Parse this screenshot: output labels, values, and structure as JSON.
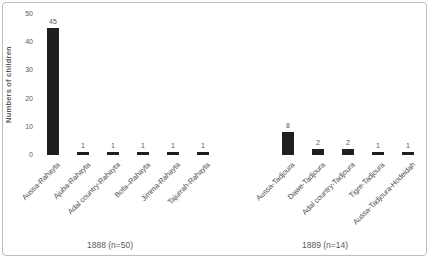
{
  "chart_data": {
    "type": "bar",
    "title": "",
    "ylabel": "Numbers of children",
    "xlabel": "",
    "ylim": [
      0,
      50
    ],
    "yticks": [
      0,
      10,
      20,
      30,
      40,
      50
    ],
    "grid": false,
    "legend": false,
    "bar_color": "#1f1f1f",
    "groups": [
      {
        "label": "1888 (n=50)",
        "categories": [
          "Aussa-Rahayta",
          "Ajuba-Rahayta",
          "Adal country-Rahayta",
          "Bofa–Rahayta",
          "Jimma-Rahayta",
          "Tajurrah-Rahayta"
        ],
        "values": [
          45,
          1,
          1,
          1,
          1,
          1
        ]
      },
      {
        "label": "1889 (n=14)",
        "categories": [
          "Aussa-Tadjoura",
          "Dawe-Tadjoura",
          "Adal country-Tadjoura",
          "Tigre-Tadjoura",
          "Aussa-Tadjoura-Hodeidah"
        ],
        "values": [
          8,
          2,
          2,
          1,
          1
        ]
      }
    ]
  },
  "frame": {
    "border_color": "#bdbdbd",
    "background": "#ffffff",
    "label_color": "#595959"
  }
}
